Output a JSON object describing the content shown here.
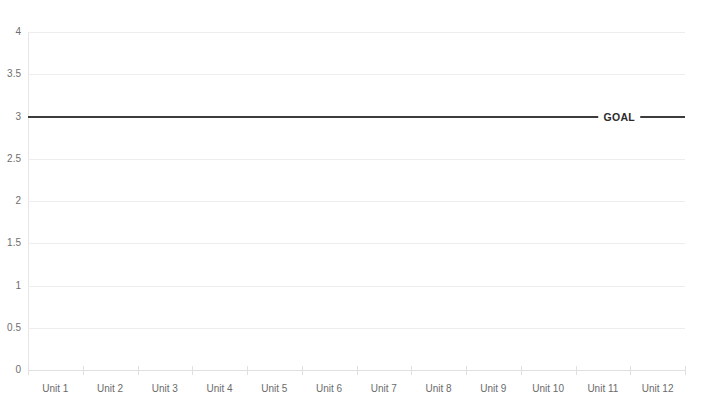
{
  "chart_data": {
    "type": "line",
    "title": "",
    "xlabel": "",
    "ylabel": "",
    "ylim": [
      0,
      4
    ],
    "grid": true,
    "legend": "none",
    "categories": [
      "Unit 1",
      "Unit 2",
      "Unit 3",
      "Unit 4",
      "Unit 5",
      "Unit 6",
      "Unit 7",
      "Unit 8",
      "Unit 9",
      "Unit 10",
      "Unit 11",
      "Unit 12"
    ],
    "y_ticks": [
      "0",
      "0.5",
      "1",
      "1.5",
      "2",
      "2.5",
      "3",
      "3.5",
      "4"
    ],
    "y_tick_values": [
      0,
      0.5,
      1,
      1.5,
      2,
      2.5,
      3,
      3.5,
      4
    ],
    "series": [
      {
        "name": "GOAL",
        "type": "reference-line",
        "value": 3,
        "color": "#3c3c3c",
        "label": "GOAL",
        "label_x_fraction": 0.9,
        "values": [
          3,
          3,
          3,
          3,
          3,
          3,
          3,
          3,
          3,
          3,
          3,
          3
        ]
      }
    ],
    "annotations": [
      {
        "text": "GOAL",
        "y": 3
      }
    ],
    "colors": {
      "goal_line": "#3c3c3c",
      "gridline": "#ededed",
      "axis": "#e0e0e0",
      "tick_label": "#6b6b6b",
      "background": "#ffffff"
    }
  },
  "axes": {
    "y_labels": [
      {
        "text": "4",
        "value": 4
      },
      {
        "text": "3.5",
        "value": 3.5
      },
      {
        "text": "3",
        "value": 3
      },
      {
        "text": "2.5",
        "value": 2.5
      },
      {
        "text": "2",
        "value": 2
      },
      {
        "text": "1.5",
        "value": 1.5
      },
      {
        "text": "1",
        "value": 1
      },
      {
        "text": "0.5",
        "value": 0.5
      },
      {
        "text": "0",
        "value": 0
      }
    ]
  }
}
